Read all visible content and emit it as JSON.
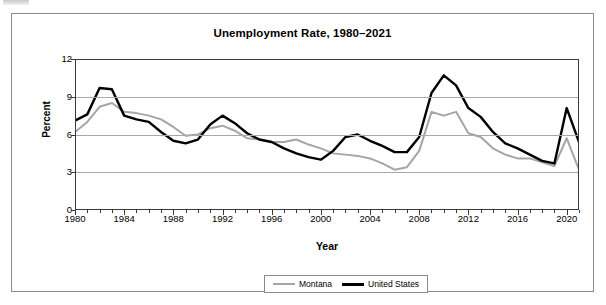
{
  "chart_data": {
    "type": "line",
    "title": "Unemployment Rate, 1980–2021",
    "xlabel": "Year",
    "ylabel": "Percent",
    "ylim": [
      0,
      12
    ],
    "xlim": [
      1980,
      2021
    ],
    "yticks": [
      0,
      3,
      6,
      9,
      12
    ],
    "xticks": [
      1980,
      1984,
      1988,
      1992,
      1996,
      2000,
      2004,
      2008,
      2012,
      2016,
      2020
    ],
    "grid": true,
    "legend_position": "bottom-center",
    "x": [
      1980,
      1981,
      1982,
      1983,
      1984,
      1985,
      1986,
      1987,
      1988,
      1989,
      1990,
      1991,
      1992,
      1993,
      1994,
      1995,
      1996,
      1997,
      1998,
      1999,
      2000,
      2001,
      2002,
      2003,
      2004,
      2005,
      2006,
      2007,
      2008,
      2009,
      2010,
      2011,
      2012,
      2013,
      2014,
      2015,
      2016,
      2017,
      2018,
      2019,
      2020,
      2021
    ],
    "series": [
      {
        "name": "Montana",
        "color": "#a5a5a5",
        "values": [
          6.2,
          7.0,
          8.2,
          8.5,
          7.8,
          7.7,
          7.5,
          7.2,
          6.6,
          5.9,
          6.0,
          6.5,
          6.7,
          6.3,
          5.7,
          5.6,
          5.4,
          5.4,
          5.6,
          5.2,
          4.9,
          4.5,
          4.4,
          4.3,
          4.1,
          3.7,
          3.2,
          3.4,
          4.7,
          7.8,
          7.5,
          7.8,
          6.1,
          5.8,
          4.9,
          4.4,
          4.1,
          4.1,
          3.8,
          3.5,
          5.7,
          3.2
        ]
      },
      {
        "name": "United States",
        "color": "#000000",
        "values": [
          7.1,
          7.6,
          9.7,
          9.6,
          7.5,
          7.2,
          7.0,
          6.2,
          5.5,
          5.3,
          5.6,
          6.8,
          7.5,
          6.9,
          6.1,
          5.6,
          5.4,
          4.9,
          4.5,
          4.2,
          4.0,
          4.7,
          5.8,
          6.0,
          5.5,
          5.1,
          4.6,
          4.6,
          5.8,
          9.3,
          10.7,
          9.9,
          8.1,
          7.4,
          6.2,
          5.3,
          4.9,
          4.4,
          3.9,
          3.7,
          8.1,
          5.4
        ]
      }
    ]
  },
  "legend": {
    "entries": [
      {
        "label": "Montana",
        "swatch": "montana-line-swatch"
      },
      {
        "label": "United States",
        "swatch": "united-states-line-swatch"
      }
    ]
  },
  "axis": {
    "y_title": "Percent",
    "x_title": "Year"
  }
}
